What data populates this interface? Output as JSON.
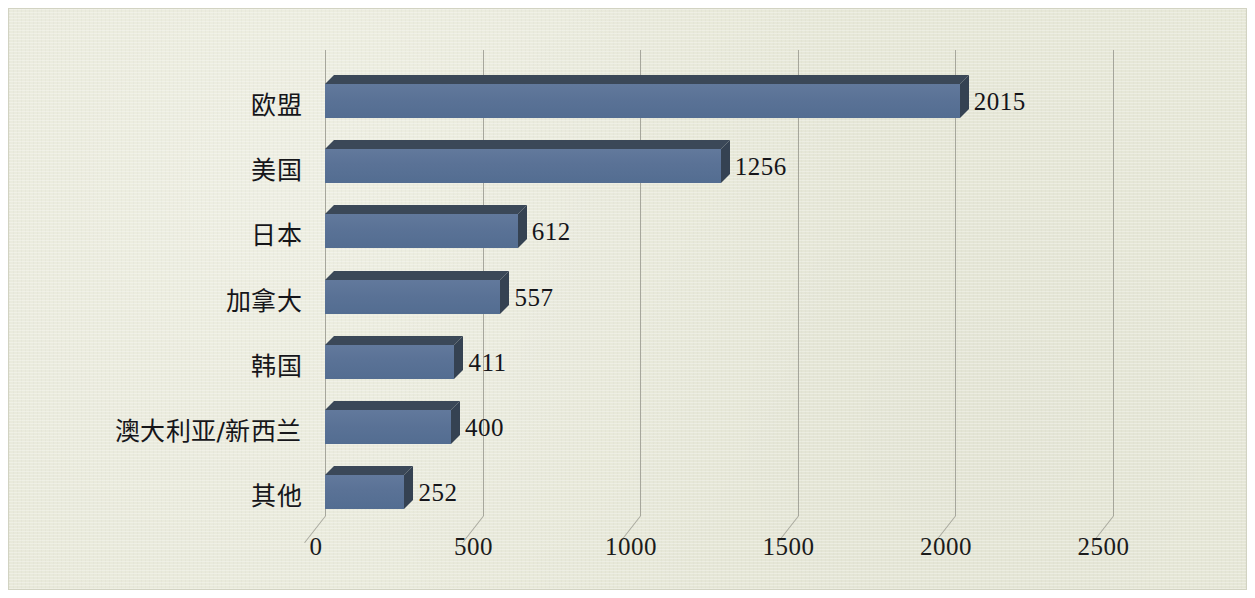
{
  "chart_data": {
    "type": "bar",
    "orientation": "horizontal",
    "style": "3d",
    "title": "",
    "subtitle": "",
    "xlabel": "",
    "ylabel": "",
    "categories": [
      "欧盟",
      "美国",
      "日本",
      "加拿大",
      "韩国",
      "澳大利亚/新西兰",
      "其他"
    ],
    "values": [
      2015,
      1256,
      612,
      557,
      411,
      400,
      252
    ],
    "value_labels": [
      "2015",
      "1256",
      "612",
      "557",
      "411",
      "400",
      "252"
    ],
    "xlim": [
      0,
      2500
    ],
    "xticks": [
      0,
      500,
      1000,
      1500,
      2000,
      2500
    ],
    "xtick_labels": [
      "0",
      "500",
      "1000",
      "1500",
      "2000",
      "2500"
    ],
    "grid": true,
    "grid_axis": "x",
    "legend": null,
    "series": [
      {
        "name": "",
        "values": [
          2015,
          1256,
          612,
          557,
          411,
          400,
          252
        ]
      }
    ]
  },
  "colors": {
    "paper": "#e8e9d9",
    "bar_front": "#5a7296",
    "bar_top": "#3b4858",
    "bar_side": "#354252",
    "grid": "#9a9a90",
    "text": "#16161a"
  }
}
